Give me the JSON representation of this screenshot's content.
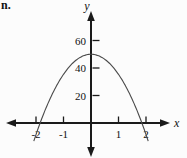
{
  "figure_label": "n.",
  "chart_data": {
    "type": "line",
    "curve": "parabola",
    "title": "",
    "xlabel": "x",
    "ylabel": "y",
    "vertex": [
      0,
      50
    ],
    "x_intercepts": [
      -1.85,
      1.85
    ],
    "equation_estimate": "y = 50 - 14.6x^2",
    "x_ticks": [
      -2,
      -1,
      1,
      2
    ],
    "x_tick_labels": [
      "-2",
      "-1",
      "1",
      "2"
    ],
    "y_ticks": [
      20,
      40,
      60
    ],
    "y_tick_labels": [
      "20",
      "40",
      "60"
    ],
    "x_range_drawn": [
      -2.08,
      2.08
    ],
    "xlim": [
      -3,
      3
    ],
    "ylim": [
      -20,
      75
    ],
    "grid": false,
    "legend": false,
    "axis_color": "#1a1a1a",
    "curve_color": "#4a4a4a",
    "label_color": "#111111"
  }
}
